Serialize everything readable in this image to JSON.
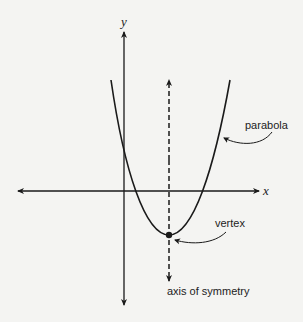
{
  "diagram": {
    "labels": {
      "y_axis": "y",
      "x_axis": "x",
      "parabola": "parabola",
      "vertex": "vertex",
      "axis_of_symmetry": "axis of symmetry"
    },
    "colors": {
      "stroke": "#1a1a1a",
      "background": "#f4f4f2"
    }
  }
}
